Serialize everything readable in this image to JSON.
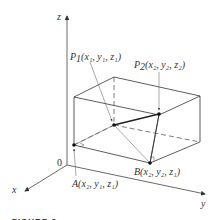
{
  "figure": {
    "caption": "FIGURE 3",
    "axes": {
      "x_label": "x",
      "y_label": "y",
      "z_label": "z",
      "origin_label": "0"
    },
    "points": {
      "P1": {
        "name": "P",
        "sub": "1",
        "coords": "(x₁, y₁, z₁)"
      },
      "P2": {
        "name": "P",
        "sub": "2",
        "coords": "(x₂, y₂, z₂)"
      },
      "A": {
        "name": "A",
        "coords": "(x₂, y₁, z₁)"
      },
      "B": {
        "name": "B",
        "coords": "(x₂, y₂, z₁)"
      }
    },
    "colors": {
      "line": "#333333",
      "leader": "#555555"
    }
  }
}
